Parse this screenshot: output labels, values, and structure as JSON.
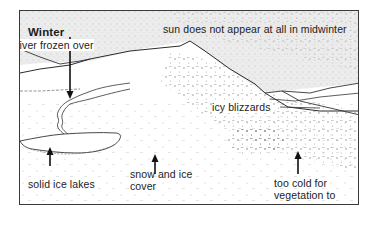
{
  "diagram": {
    "title": "Winter",
    "colors": {
      "frame": "#3a3a3a",
      "sky": "#e6e6e6",
      "ink": "#1c1c1c",
      "background": "#ffffff"
    },
    "labels": {
      "sun": "sun does not appear at all in midwinter",
      "river": "river frozen over",
      "blizzards": "icy blizzards",
      "lakes": "solid ice lakes",
      "snow_line1": "snow and ice",
      "snow_line2": "cover",
      "veg_line1": "too cold for",
      "veg_line2": "vegetation to",
      "veg_line3": "grow"
    },
    "icons": {
      "arrow": "arrow-up",
      "arrow_down": "arrow-down"
    }
  }
}
